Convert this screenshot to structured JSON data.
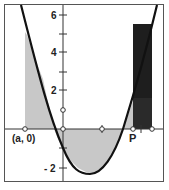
{
  "figure": {
    "type": "diagram",
    "y_axis_ticks": [
      {
        "value": 6,
        "label": "6",
        "py": 15
      },
      {
        "value": 5,
        "label": "",
        "py": 34
      },
      {
        "value": 4,
        "label": "4",
        "py": 52
      },
      {
        "value": 3,
        "label": "",
        "py": 72
      },
      {
        "value": 2,
        "label": "2",
        "py": 90
      },
      {
        "value": 1,
        "label": "",
        "py": 110
      },
      {
        "value": -1,
        "label": "",
        "py": 148
      },
      {
        "value": -2,
        "label": "- 2",
        "py": 168
      }
    ],
    "point_labels": {
      "a_point": "(a, 0)",
      "p_point": "P"
    },
    "colors": {
      "curve": "#111111",
      "light_shade": "#c8c8c8",
      "dark_rect": "#1e1e1e",
      "axis": "#333333",
      "frame": "#555555"
    }
  }
}
